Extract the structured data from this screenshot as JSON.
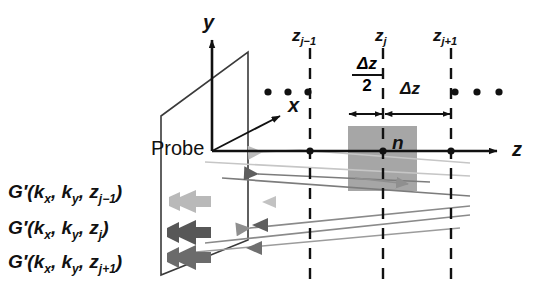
{
  "figure": {
    "background_color": "#ffffff",
    "line_color": "#111111",
    "slab_fill_color": "#a6a6a6",
    "plane_stroke_color": "#3a3a3a"
  },
  "axes": {
    "y_label": "y",
    "x_label": "x",
    "z_label": "z",
    "origin_label": "Probe"
  },
  "planes": {
    "tick_labels": [
      {
        "base": "z",
        "sub": "j−1",
        "text": "z j−1"
      },
      {
        "base": "z",
        "sub": "j",
        "text": "z j"
      },
      {
        "base": "z",
        "sub": "j+1",
        "text": "z j+1"
      }
    ]
  },
  "slab": {
    "refractive_index_label": "n"
  },
  "dimensions": {
    "half_step": {
      "numerator": "Δz",
      "denominator": "2"
    },
    "full_step": "Δz"
  },
  "ellipses": {
    "left_dots": "• • •",
    "right_dots": "• • •"
  },
  "wavefields": [
    {
      "text": "G′(kₓ, kᵧ, zⱼ₋₁)",
      "prefix": "G′(k",
      "s1": "x",
      "mid": ", k",
      "s2": "y",
      "mid2": ", z",
      "s3": "j−1",
      "suffix": ")"
    },
    {
      "text": "G′(kₓ, kᵧ, zⱼ)",
      "prefix": "G′(k",
      "s1": "x",
      "mid": ", k",
      "s2": "y",
      "mid2": ", z",
      "s3": "j",
      "suffix": ")"
    },
    {
      "text": "G′(kₓ, kᵧ, zⱼ₊₁)",
      "prefix": "G′(k",
      "s1": "x",
      "mid": ", k",
      "s2": "y",
      "mid2": ", z",
      "s3": "j+1",
      "suffix": ")"
    }
  ],
  "beams": [
    {
      "name": "beam-upper",
      "shade": "#bfbfbf"
    },
    {
      "name": "beam-middle",
      "shade": "#6e6e6e"
    },
    {
      "name": "beam-lower",
      "shade": "#8a8a8a"
    }
  ]
}
